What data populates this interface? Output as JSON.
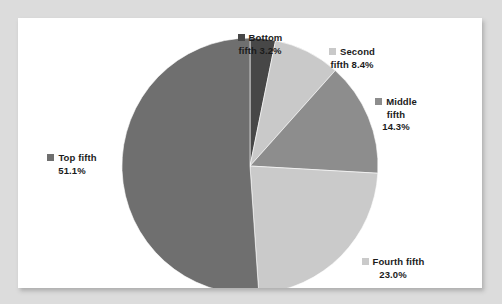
{
  "chart_data": {
    "type": "pie",
    "title": "",
    "subtitle": "",
    "xlabel": "",
    "ylabel": "",
    "legend_position": "callout-labels",
    "grid": false,
    "categories": [
      "Bottom fifth",
      "Second fifth",
      "Middle fifth",
      "Fourth fifth",
      "Top fifth"
    ],
    "values": [
      3.2,
      8.4,
      14.3,
      23.0,
      51.1
    ],
    "value_suffix": "%",
    "slice_order_clockwise_from_top": [
      "Bottom fifth",
      "Second fifth",
      "Middle fifth",
      "Fourth fifth",
      "Top fifth"
    ],
    "colors": [
      "#474747",
      "#c9c9c9",
      "#8d8d8d",
      "#cacaca",
      "#6f6f6f"
    ],
    "slices": [
      {
        "name": "Bottom fifth",
        "value": 3.2,
        "value_text": "3.2%",
        "color": "#474747",
        "label_lines": [
          "Bottom",
          "fifth 3.2%"
        ]
      },
      {
        "name": "Second fifth",
        "value": 8.4,
        "value_text": "8.4%",
        "color": "#c9c9c9",
        "label_lines": [
          "Second",
          "fifth 8.4%"
        ]
      },
      {
        "name": "Middle fifth",
        "value": 14.3,
        "value_text": "14.3%",
        "color": "#8d8d8d",
        "label_lines": [
          "Middle",
          "fifth",
          "14.3%"
        ]
      },
      {
        "name": "Fourth fifth",
        "value": 23.0,
        "value_text": "23.0%",
        "color": "#cacaca",
        "label_lines": [
          "Fourth fifth",
          "23.0%"
        ]
      },
      {
        "name": "Top fifth",
        "value": 51.1,
        "value_text": "51.1%",
        "color": "#6f6f6f",
        "label_lines": [
          "Top fifth",
          "51.1%"
        ]
      }
    ]
  },
  "labels": {
    "bottom": {
      "line1": "Bottom",
      "line2": "fifth 3.2%"
    },
    "second": {
      "line1": "Second",
      "line2": "fifth 8.4%"
    },
    "middle": {
      "line1": "Middle",
      "line2": "fifth",
      "line3": "14.3%"
    },
    "fourth": {
      "line1": "Fourth fifth",
      "line2": "23.0%"
    },
    "top": {
      "line1": "Top fifth",
      "line2": "51.1%"
    }
  },
  "style": {
    "page_background": "#dcdcdc",
    "panel_background": "#ffffff",
    "text_color": "#1b1b1b"
  }
}
